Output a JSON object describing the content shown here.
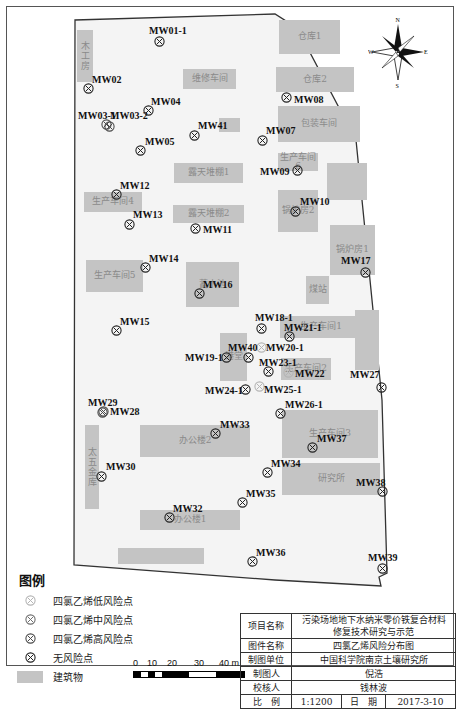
{
  "map": {
    "compass": {
      "n": "N",
      "s": "S",
      "e": "E",
      "w": "W"
    },
    "buildings": [
      {
        "name": "木工房",
        "x": 77,
        "y": 30,
        "w": 16,
        "h": 52,
        "vertical": true
      },
      {
        "name": "维修车间",
        "x": 183,
        "y": 69,
        "w": 53,
        "h": 20
      },
      {
        "name": "仓库1",
        "x": 279,
        "y": 20,
        "w": 61,
        "h": 34
      },
      {
        "name": "仓库2",
        "x": 276,
        "y": 67,
        "w": 78,
        "h": 25
      },
      {
        "name": "包装车间",
        "x": 278,
        "y": 106,
        "w": 82,
        "h": 36
      },
      {
        "name": "",
        "x": 219,
        "y": 118,
        "w": 21,
        "h": 14
      },
      {
        "name": "露天堆棚1",
        "x": 174,
        "y": 163,
        "w": 69,
        "h": 20
      },
      {
        "name": "生产车间6",
        "x": 278,
        "y": 153,
        "w": 40,
        "h": 18
      },
      {
        "name": "",
        "x": 327,
        "y": 163,
        "w": 40,
        "h": 37
      },
      {
        "name": "生产车间4",
        "x": 84,
        "y": 192,
        "w": 58,
        "h": 20
      },
      {
        "name": "露天堆棚2",
        "x": 173,
        "y": 205,
        "w": 71,
        "h": 18
      },
      {
        "name": "锅炉房2",
        "x": 278,
        "y": 190,
        "w": 40,
        "h": 42
      },
      {
        "name": "锅炉房1",
        "x": 330,
        "y": 225,
        "w": 45,
        "h": 50
      },
      {
        "name": "生产车间5",
        "x": 86,
        "y": 260,
        "w": 57,
        "h": 32
      },
      {
        "name": "蓄水池",
        "x": 186,
        "y": 262,
        "w": 53,
        "h": 45
      },
      {
        "name": "煤站",
        "x": 306,
        "y": 276,
        "w": 23,
        "h": 28
      },
      {
        "name": "生产车间1",
        "x": 280,
        "y": 316,
        "w": 82,
        "h": 22
      },
      {
        "name": "",
        "x": 355,
        "y": 310,
        "w": 24,
        "h": 60
      },
      {
        "name": "港堂",
        "x": 220,
        "y": 333,
        "w": 27,
        "h": 48
      },
      {
        "name": "生产车间2",
        "x": 281,
        "y": 358,
        "w": 50,
        "h": 22
      },
      {
        "name": "办公楼2",
        "x": 140,
        "y": 425,
        "w": 110,
        "h": 32
      },
      {
        "name": "生产车间3",
        "x": 282,
        "y": 410,
        "w": 96,
        "h": 48
      },
      {
        "name": "研究所",
        "x": 282,
        "y": 463,
        "w": 98,
        "h": 32
      },
      {
        "name": "太五金库",
        "x": 85,
        "y": 425,
        "w": 14,
        "h": 84,
        "vertical": true
      },
      {
        "name": "办公楼1",
        "x": 140,
        "y": 510,
        "w": 100,
        "h": 20
      },
      {
        "name": "",
        "x": 118,
        "y": 548,
        "w": 86,
        "h": 16
      }
    ],
    "wells": [
      {
        "id": "MW01-1",
        "x": 160,
        "y": 42,
        "risk": "none",
        "lx": 149,
        "ly": 25
      },
      {
        "id": "MW02",
        "x": 89,
        "y": 89,
        "risk": "none",
        "lx": 92,
        "ly": 74
      },
      {
        "id": "MW03-1",
        "x": 107,
        "y": 125,
        "risk": "high",
        "lx": 78,
        "ly": 110
      },
      {
        "id": "MW03-2",
        "x": 110,
        "y": 127,
        "risk": "high",
        "lx": 110,
        "ly": 110
      },
      {
        "id": "MW04",
        "x": 149,
        "y": 111,
        "risk": "none",
        "lx": 151,
        "ly": 96
      },
      {
        "id": "MW05",
        "x": 141,
        "y": 151,
        "risk": "none",
        "lx": 145,
        "ly": 136
      },
      {
        "id": "MW41",
        "x": 195,
        "y": 136,
        "risk": "none",
        "lx": 198,
        "ly": 120
      },
      {
        "id": "MW07",
        "x": 263,
        "y": 141,
        "risk": "none",
        "lx": 266,
        "ly": 125
      },
      {
        "id": "MW08",
        "x": 287,
        "y": 98,
        "risk": "none",
        "lx": 294,
        "ly": 94
      },
      {
        "id": "MW09",
        "x": 298,
        "y": 171,
        "risk": "none",
        "lx": 260,
        "ly": 166
      },
      {
        "id": "MW10",
        "x": 296,
        "y": 212,
        "risk": "none",
        "lx": 300,
        "ly": 196
      },
      {
        "id": "MW11",
        "x": 196,
        "y": 229,
        "risk": "none",
        "lx": 203,
        "ly": 224
      },
      {
        "id": "MW12",
        "x": 117,
        "y": 195,
        "risk": "none",
        "lx": 120,
        "ly": 180
      },
      {
        "id": "MW13",
        "x": 130,
        "y": 225,
        "risk": "none",
        "lx": 133,
        "ly": 209
      },
      {
        "id": "MW14",
        "x": 146,
        "y": 268,
        "risk": "none",
        "lx": 149,
        "ly": 253
      },
      {
        "id": "MW15",
        "x": 117,
        "y": 331,
        "risk": "none",
        "lx": 120,
        "ly": 316
      },
      {
        "id": "MW16",
        "x": 200,
        "y": 294,
        "risk": "none",
        "lx": 203,
        "ly": 279
      },
      {
        "id": "MW17",
        "x": 366,
        "y": 273,
        "risk": "none",
        "lx": 341,
        "ly": 255
      },
      {
        "id": "MW18-1",
        "x": 262,
        "y": 329,
        "risk": "none",
        "lx": 255,
        "ly": 312
      },
      {
        "id": "MW19-1",
        "x": 227,
        "y": 358,
        "risk": "none",
        "lx": 185,
        "ly": 352
      },
      {
        "id": "MW20-1",
        "x": 262,
        "y": 348,
        "risk": "low",
        "lx": 266,
        "ly": 342
      },
      {
        "id": "MW21-1",
        "x": 290,
        "y": 337,
        "risk": "none",
        "lx": 284,
        "ly": 322
      },
      {
        "id": "MW22",
        "x": 289,
        "y": 373,
        "risk": "low",
        "lx": 295,
        "ly": 368
      },
      {
        "id": "MW23-1",
        "x": 269,
        "y": 372,
        "risk": "none",
        "lx": 259,
        "ly": 357
      },
      {
        "id": "MW24-1",
        "x": 246,
        "y": 390,
        "risk": "none",
        "lx": 205,
        "ly": 385
      },
      {
        "id": "MW25-1",
        "x": 260,
        "y": 387,
        "risk": "low",
        "lx": 264,
        "ly": 384
      },
      {
        "id": "MW26-1",
        "x": 281,
        "y": 414,
        "risk": "none",
        "lx": 285,
        "ly": 399
      },
      {
        "id": "MW27",
        "x": 382,
        "y": 388,
        "risk": "none",
        "lx": 350,
        "ly": 369
      },
      {
        "id": "MW28",
        "x": 104,
        "y": 412,
        "risk": "high",
        "lx": 110,
        "ly": 406
      },
      {
        "id": "MW29",
        "x": 103,
        "y": 413,
        "risk": "high",
        "lx": 88,
        "ly": 397
      },
      {
        "id": "MW30",
        "x": 102,
        "y": 477,
        "risk": "none",
        "lx": 106,
        "ly": 461
      },
      {
        "id": "MW32",
        "x": 170,
        "y": 518,
        "risk": "none",
        "lx": 173,
        "ly": 503
      },
      {
        "id": "MW33",
        "x": 216,
        "y": 434,
        "risk": "none",
        "lx": 220,
        "ly": 419
      },
      {
        "id": "MW34",
        "x": 268,
        "y": 473,
        "risk": "none",
        "lx": 271,
        "ly": 458
      },
      {
        "id": "MW35",
        "x": 243,
        "y": 503,
        "risk": "none",
        "lx": 246,
        "ly": 488
      },
      {
        "id": "MW36",
        "x": 253,
        "y": 562,
        "risk": "none",
        "lx": 256,
        "ly": 547
      },
      {
        "id": "MW37",
        "x": 313,
        "y": 448,
        "risk": "none",
        "lx": 317,
        "ly": 433
      },
      {
        "id": "MW38",
        "x": 383,
        "y": 492,
        "risk": "none",
        "lx": 356,
        "ly": 477
      },
      {
        "id": "MW39",
        "x": 383,
        "y": 569,
        "risk": "none",
        "lx": 368,
        "ly": 552
      },
      {
        "id": "MW40",
        "x": 249,
        "y": 358,
        "risk": "none",
        "lx": 228,
        "ly": 342
      }
    ]
  },
  "legend": {
    "title": "图例",
    "items": [
      {
        "label": "四氯乙烯低风险点",
        "risk": "low"
      },
      {
        "label": "四氯乙烯中风险点",
        "risk": "medium"
      },
      {
        "label": "四氯乙烯高风险点",
        "risk": "high"
      },
      {
        "label": "无风险点",
        "risk": "none"
      },
      {
        "label": "建筑物",
        "risk": "building"
      }
    ],
    "risk_colors": {
      "low": "#b5b5b5",
      "medium": "#6e6e6e",
      "high": "#4a4a4a",
      "none": "#222222"
    },
    "building_color": "#c4c4c4"
  },
  "scale": {
    "ticks": [
      "0",
      "10",
      "20",
      "30",
      "40 m"
    ]
  },
  "title_block": {
    "project_label": "项目名称",
    "project_value_line1": "污染场地地下水纳米零价铁复合材料",
    "project_value_line2": "修复技术研究与示范",
    "figure_label": "图件名称",
    "figure_value": "四氯乙烯风险分布图",
    "unit_label": "制图单位",
    "unit_value": "中国科学院南京土壤研究所",
    "author_label": "制图人",
    "author_value": "倪浩",
    "checker_label": "校核人",
    "checker_value": "钱林波",
    "scale_label": "比　例",
    "scale_value": "1:1200",
    "date_label": "日　期",
    "date_value": "2017-3-10"
  }
}
